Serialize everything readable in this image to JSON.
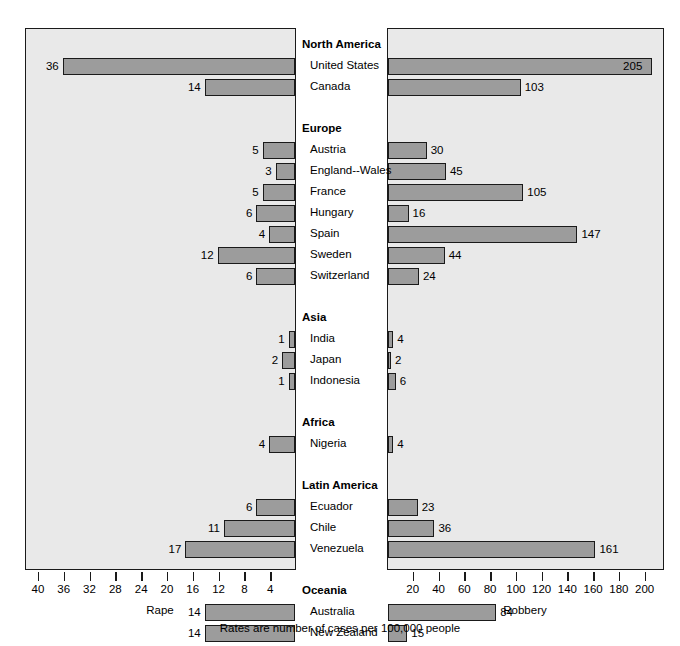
{
  "caption": "Rates are number of cases per 100,000 people",
  "left_axis": {
    "title": "Rape",
    "ticks": [
      40,
      36,
      32,
      28,
      24,
      20,
      16,
      12,
      8,
      4
    ],
    "max": 42,
    "reversed": true
  },
  "right_axis": {
    "title": "Robbery",
    "ticks": [
      20,
      40,
      60,
      80,
      100,
      120,
      140,
      160,
      180,
      200
    ],
    "max": 215
  },
  "colors": {
    "bar_fill": "#9c9c9c",
    "bar_stroke": "#1a1a1a",
    "panel_bg": "#e9e9e9",
    "label_bg": "#ffffff"
  },
  "rows": [
    {
      "type": "group",
      "label": "North America"
    },
    {
      "type": "country",
      "label": "United States",
      "rape": 36,
      "robbery": 205
    },
    {
      "type": "country",
      "label": "Canada",
      "rape": 14,
      "robbery": 103
    },
    {
      "type": "spacer",
      "label": ""
    },
    {
      "type": "group",
      "label": "Europe"
    },
    {
      "type": "country",
      "label": "Austria",
      "rape": 5,
      "robbery": 30
    },
    {
      "type": "country",
      "label": "England--Wales",
      "rape": 3,
      "robbery": 45
    },
    {
      "type": "country",
      "label": "France",
      "rape": 5,
      "robbery": 105
    },
    {
      "type": "country",
      "label": "Hungary",
      "rape": 6,
      "robbery": 16
    },
    {
      "type": "country",
      "label": "Spain",
      "rape": 4,
      "robbery": 147
    },
    {
      "type": "country",
      "label": "Sweden",
      "rape": 12,
      "robbery": 44
    },
    {
      "type": "country",
      "label": "Switzerland",
      "rape": 6,
      "robbery": 24
    },
    {
      "type": "spacer",
      "label": ""
    },
    {
      "type": "group",
      "label": "Asia"
    },
    {
      "type": "country",
      "label": "India",
      "rape": 1,
      "robbery": 4
    },
    {
      "type": "country",
      "label": "Japan",
      "rape": 2,
      "robbery": 2
    },
    {
      "type": "country",
      "label": "Indonesia",
      "rape": 1,
      "robbery": 6
    },
    {
      "type": "spacer",
      "label": ""
    },
    {
      "type": "group",
      "label": "Africa"
    },
    {
      "type": "country",
      "label": "Nigeria",
      "rape": 4,
      "robbery": 4
    },
    {
      "type": "spacer",
      "label": ""
    },
    {
      "type": "group",
      "label": "Latin America"
    },
    {
      "type": "country",
      "label": "Ecuador",
      "rape": 6,
      "robbery": 23
    },
    {
      "type": "country",
      "label": "Chile",
      "rape": 11,
      "robbery": 36
    },
    {
      "type": "country",
      "label": "Venezuela",
      "rape": 17,
      "robbery": 161
    },
    {
      "type": "spacer",
      "label": ""
    },
    {
      "type": "group",
      "label": "Oceania"
    },
    {
      "type": "country",
      "label": "Australia",
      "rape": 14,
      "robbery": 84
    },
    {
      "type": "country",
      "label": "New Zealand",
      "rape": 14,
      "robbery": 15
    }
  ],
  "chart_data": {
    "type": "bar",
    "title": "",
    "subtitle": "",
    "orientation": "horizontal-bidirectional",
    "categories": [
      "United States",
      "Canada",
      "Austria",
      "England--Wales",
      "France",
      "Hungary",
      "Spain",
      "Sweden",
      "Switzerland",
      "India",
      "Japan",
      "Indonesia",
      "Nigeria",
      "Ecuador",
      "Chile",
      "Venezuela",
      "Australia",
      "New Zealand"
    ],
    "category_groups": [
      {
        "name": "North America",
        "members": [
          "United States",
          "Canada"
        ]
      },
      {
        "name": "Europe",
        "members": [
          "Austria",
          "England--Wales",
          "France",
          "Hungary",
          "Spain",
          "Sweden",
          "Switzerland"
        ]
      },
      {
        "name": "Asia",
        "members": [
          "India",
          "Japan",
          "Indonesia"
        ]
      },
      {
        "name": "Africa",
        "members": [
          "Nigeria"
        ]
      },
      {
        "name": "Latin America",
        "members": [
          "Ecuador",
          "Chile",
          "Venezuela"
        ]
      },
      {
        "name": "Oceania",
        "members": [
          "Australia",
          "New Zealand"
        ]
      }
    ],
    "series": [
      {
        "name": "Rape",
        "side": "left",
        "values": [
          36,
          14,
          5,
          3,
          5,
          6,
          4,
          12,
          6,
          1,
          2,
          1,
          4,
          6,
          11,
          17,
          14,
          14
        ],
        "axis_ticks": [
          40,
          36,
          32,
          28,
          24,
          20,
          16,
          12,
          8,
          4
        ],
        "axis_direction": "right-to-left",
        "xlim": [
          42,
          0
        ]
      },
      {
        "name": "Robbery",
        "side": "right",
        "values": [
          205,
          103,
          30,
          45,
          105,
          16,
          147,
          44,
          24,
          4,
          2,
          6,
          4,
          23,
          36,
          161,
          84,
          15
        ],
        "axis_ticks": [
          20,
          40,
          60,
          80,
          100,
          120,
          140,
          160,
          180,
          200
        ],
        "axis_direction": "left-to-right",
        "xlim": [
          0,
          215
        ]
      }
    ],
    "xlabel": "",
    "ylabel": "",
    "annotations": [
      "Rates are number of cases per 100,000 people"
    ],
    "grid": false,
    "legend": "none",
    "data_labels": true
  }
}
